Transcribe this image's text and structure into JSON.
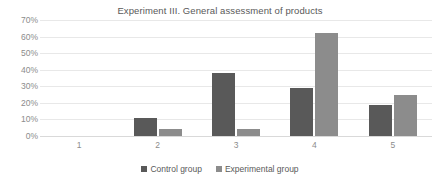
{
  "chart_data": {
    "type": "bar",
    "title": "Experiment III. General assessment of products",
    "xlabel": "",
    "ylabel": "",
    "categories": [
      "1",
      "2",
      "3",
      "4",
      "5"
    ],
    "series": [
      {
        "name": "Control group",
        "color": "#595959",
        "values": [
          0,
          11,
          38,
          29,
          19
        ]
      },
      {
        "name": "Experimental group",
        "color": "#8c8c8c",
        "values": [
          0,
          4,
          4,
          62,
          25
        ]
      }
    ],
    "ylim": [
      0,
      70
    ],
    "ytick_values": [
      0,
      10,
      20,
      30,
      40,
      50,
      60,
      70
    ],
    "ytick_labels": [
      "0%",
      "10%",
      "20%",
      "30%",
      "40%",
      "50%",
      "60%",
      "70%"
    ],
    "grid": true,
    "grid_axis": "y",
    "legend_position": "bottom",
    "value_suffix": "%"
  },
  "theme": {
    "background": "#ffffff",
    "title_color": "#595959",
    "tick_color": "#8c8c8c",
    "gridline_color": "#e8e8e8",
    "axis_line_color": "#d9d9d9"
  }
}
